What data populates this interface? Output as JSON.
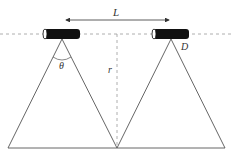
{
  "diagram": {
    "labels": {
      "distance": "L",
      "angle": "θ",
      "height": "r",
      "detector": "D"
    },
    "colors": {
      "line": "#555555",
      "dash": "#999999",
      "body": "#111111"
    },
    "elements": [
      {
        "type": "cylinder",
        "name": "left-sensor",
        "x": 43,
        "y": 29,
        "w": 37,
        "h": 10
      },
      {
        "type": "cylinder",
        "name": "right-sensor",
        "x": 152,
        "y": 29,
        "w": 37,
        "h": 10
      },
      {
        "type": "cone",
        "name": "left-cone",
        "apex": [
          62,
          39
        ],
        "base": [
          8,
          117
        ]
      },
      {
        "type": "cone",
        "name": "right-cone",
        "apex": [
          171,
          39
        ],
        "base": [
          117,
          225
        ]
      },
      {
        "type": "arrow",
        "name": "distance-arrow",
        "from": [
          65,
          20
        ],
        "to": [
          170,
          20
        ]
      },
      {
        "type": "dashed-line",
        "name": "horizontal-axis",
        "y": 34
      },
      {
        "type": "dashed-line",
        "name": "vertical-r",
        "x": 117,
        "y1": 34,
        "y2": 148
      }
    ]
  }
}
